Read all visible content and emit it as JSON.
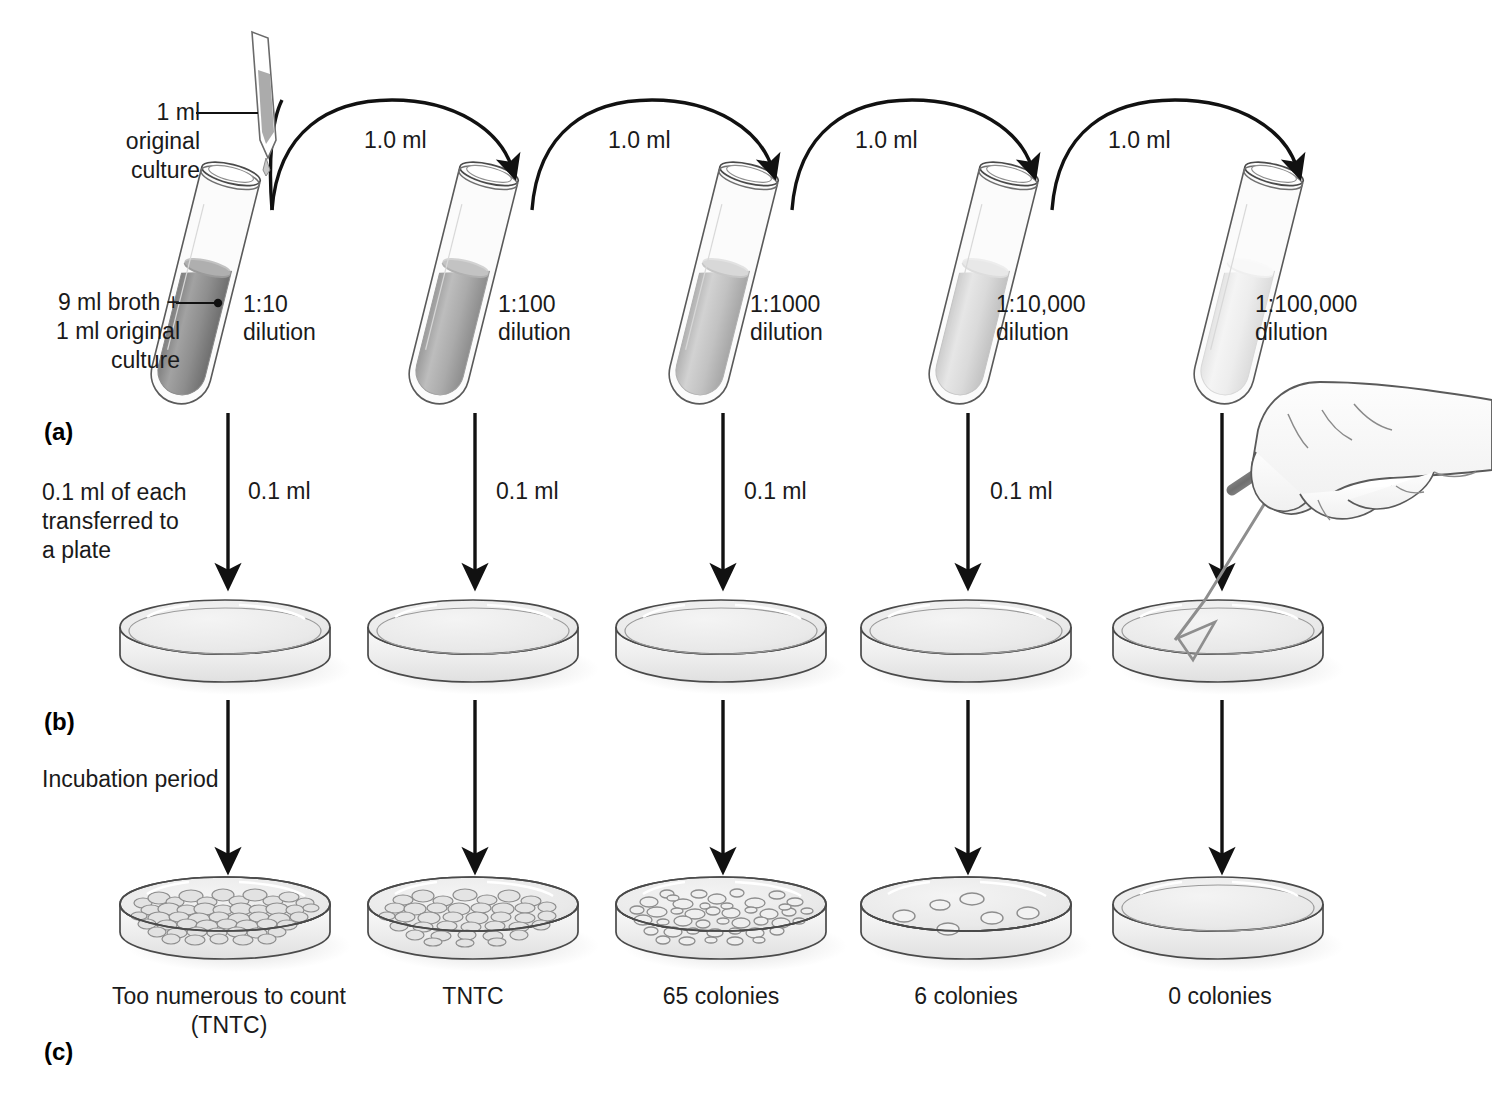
{
  "figure": {
    "panels": [
      {
        "id": "a",
        "label": "(a)"
      },
      {
        "id": "b",
        "label": "(b)"
      },
      {
        "id": "c",
        "label": "(c)"
      }
    ]
  },
  "annotations": {
    "original_culture": "1 ml original\nculture",
    "broth_note": "9 ml broth +\n1 ml original\nculture",
    "transfer_note": "0.1 ml of each\ntransferred to\na plate",
    "incubation_note": "Incubation period"
  },
  "transfer_volume_label": "1.0 ml",
  "plate_volume_label": "0.1 ml",
  "columns": [
    {
      "index": 1,
      "dilution": "1:10",
      "dilution_suffix": "dilution",
      "transfer_in": "1.0 ml",
      "plate_volume": "0.1 ml",
      "result": "Too numerous to count\n(TNTC)",
      "colony_count": "TNTC",
      "fill_color": "#8c8c8c",
      "colony_density": "confluent"
    },
    {
      "index": 2,
      "dilution": "1:100",
      "dilution_suffix": "dilution",
      "transfer_in": "1.0 ml",
      "plate_volume": "0.1 ml",
      "result": "TNTC",
      "colony_count": "TNTC",
      "fill_color": "#a6a6a6",
      "colony_density": "confluent"
    },
    {
      "index": 3,
      "dilution": "1:1000",
      "dilution_suffix": "dilution",
      "transfer_in": "1.0 ml",
      "plate_volume": "0.1 ml",
      "result": "65 colonies",
      "colony_count": "65",
      "fill_color": "#bdbdbd",
      "colony_density": "countable"
    },
    {
      "index": 4,
      "dilution": "1:10,000",
      "dilution_suffix": "dilution",
      "transfer_in": "1.0 ml",
      "plate_volume": "0.1 ml",
      "result": "6 colonies",
      "colony_count": "6",
      "fill_color": "#d6d6d6",
      "colony_density": "sparse"
    },
    {
      "index": 5,
      "dilution": "1:100,000",
      "dilution_suffix": "dilution",
      "transfer_in": "1.0 ml",
      "plate_volume": "0.1 ml",
      "result": "0 colonies",
      "colony_count": "0",
      "fill_color": "#efefef",
      "colony_density": "none"
    }
  ],
  "icons": {
    "pipette": "pipette-icon",
    "hand_spreader": "hand-with-spreader-icon",
    "test_tube": "test-tube-icon",
    "petri_dish": "petri-dish-icon",
    "arc_arrow": "arc-arrow-icon",
    "down_arrow": "down-arrow-icon"
  },
  "colors": {
    "ink": "#1a1a1a",
    "outline": "#4a4a4a",
    "glass": "#f7f7f7",
    "agar": "#ececec",
    "shadow": "#d8d8d8"
  }
}
